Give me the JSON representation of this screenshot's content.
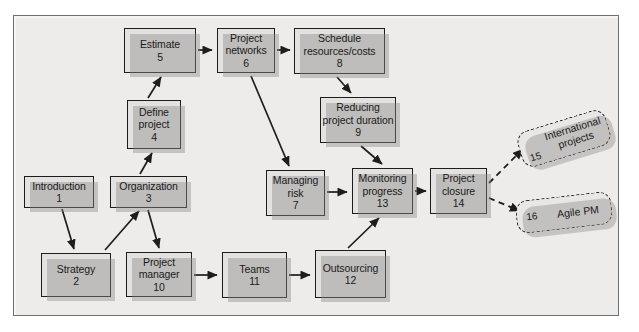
{
  "diagram": {
    "frame": {
      "background_color": "#edecea",
      "border_color": "#6f6f6f"
    },
    "node_style": {
      "fill": "#e3e2e0",
      "border": "#1d1d1d",
      "shadow": "#8c8a88"
    },
    "nodes": [
      {
        "id": "n1",
        "label": "Introduction",
        "label2": "",
        "number": "1",
        "x": 24,
        "y": 176,
        "w": 70,
        "h": 32
      },
      {
        "id": "n2",
        "label": "Strategy",
        "label2": "",
        "number": "2",
        "x": 41,
        "y": 253,
        "w": 70,
        "h": 44
      },
      {
        "id": "n3",
        "label": "Organization",
        "label2": "",
        "number": "3",
        "x": 110,
        "y": 176,
        "w": 77,
        "h": 32
      },
      {
        "id": "n4",
        "label": "Define",
        "label2": "project",
        "number": "4",
        "x": 127,
        "y": 100,
        "w": 54,
        "h": 49
      },
      {
        "id": "n5",
        "label": "Estimate",
        "label2": "",
        "number": "5",
        "x": 124,
        "y": 28,
        "w": 72,
        "h": 45
      },
      {
        "id": "n6",
        "label": "Project",
        "label2": "networks",
        "number": "6",
        "x": 217,
        "y": 28,
        "w": 58,
        "h": 45
      },
      {
        "id": "n7",
        "label": "Managing",
        "label2": "risk",
        "number": "7",
        "x": 266,
        "y": 170,
        "w": 59,
        "h": 46
      },
      {
        "id": "n8",
        "label": "Schedule",
        "label2": "resources/costs",
        "number": "8",
        "x": 294,
        "y": 28,
        "w": 91,
        "h": 46
      },
      {
        "id": "n9",
        "label": "Reducing",
        "label2": "project duration",
        "number": "9",
        "x": 320,
        "y": 97,
        "w": 76,
        "h": 46
      },
      {
        "id": "n10",
        "label": "Project",
        "label2": "manager",
        "number": "10",
        "x": 126,
        "y": 252,
        "w": 66,
        "h": 45
      },
      {
        "id": "n11",
        "label": "Teams",
        "label2": "",
        "number": "11",
        "x": 222,
        "y": 252,
        "w": 65,
        "h": 46
      },
      {
        "id": "n12",
        "label": "Outsourcing",
        "label2": "",
        "number": "12",
        "x": 315,
        "y": 250,
        "w": 71,
        "h": 48
      },
      {
        "id": "n13",
        "label": "Monitoring",
        "label2": "progress",
        "number": "13",
        "x": 352,
        "y": 168,
        "w": 61,
        "h": 46
      },
      {
        "id": "n14",
        "label": "Project",
        "label2": "closure",
        "number": "14",
        "x": 430,
        "y": 168,
        "w": 57,
        "h": 46
      }
    ],
    "notes": [
      {
        "id": "note15",
        "number": "15",
        "label": "International projects",
        "style": "dashed-rounded"
      },
      {
        "id": "note16",
        "number": "16",
        "label": "Agile PM",
        "style": "dashed-rounded"
      }
    ],
    "edges": [
      {
        "from": "n1",
        "to": "n2",
        "style": "solid"
      },
      {
        "from": "n2",
        "to": "n3",
        "style": "solid"
      },
      {
        "from": "n3",
        "to": "n4",
        "style": "solid"
      },
      {
        "from": "n3",
        "to": "n10",
        "style": "solid"
      },
      {
        "from": "n4",
        "to": "n5",
        "style": "solid"
      },
      {
        "from": "n5",
        "to": "n6",
        "style": "solid"
      },
      {
        "from": "n6",
        "to": "n8",
        "style": "solid"
      },
      {
        "from": "n6",
        "to": "n7",
        "style": "solid"
      },
      {
        "from": "n8",
        "to": "n9",
        "style": "solid"
      },
      {
        "from": "n9",
        "to": "n13",
        "style": "solid"
      },
      {
        "from": "n7",
        "to": "n13",
        "style": "solid"
      },
      {
        "from": "n10",
        "to": "n11",
        "style": "solid"
      },
      {
        "from": "n11",
        "to": "n12",
        "style": "solid"
      },
      {
        "from": "n12",
        "to": "n13",
        "style": "solid"
      },
      {
        "from": "n13",
        "to": "n14",
        "style": "solid"
      },
      {
        "from": "n14",
        "to": "note15",
        "style": "dashed"
      },
      {
        "from": "n14",
        "to": "note16",
        "style": "dashed"
      }
    ]
  }
}
